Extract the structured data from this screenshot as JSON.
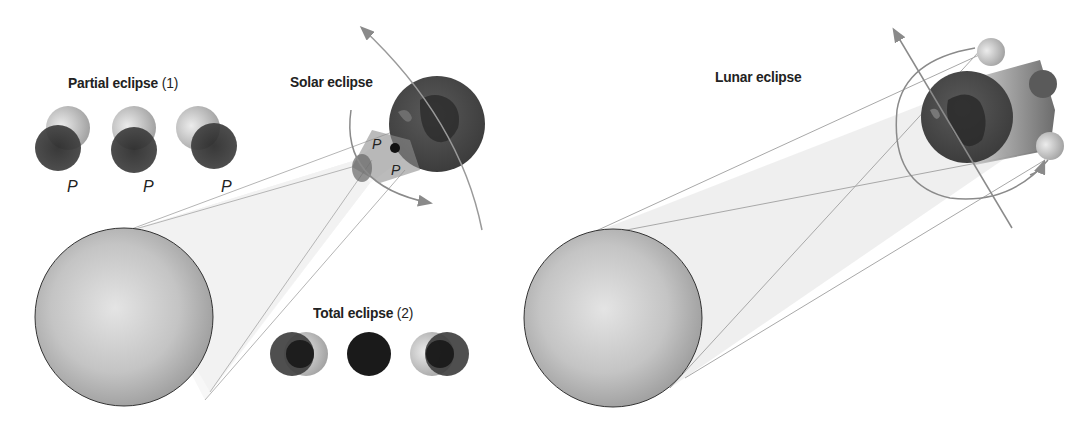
{
  "diagram": {
    "solar": {
      "title": "Solar eclipse",
      "partial": {
        "label": "Partial eclipse",
        "number": "(1)",
        "phase_marker": "P"
      },
      "total": {
        "label": "Total eclipse",
        "number": "(2)"
      },
      "penumbra_markers": [
        "P",
        "P"
      ],
      "bodies": [
        "sun",
        "moon",
        "earth"
      ]
    },
    "lunar": {
      "title": "Lunar eclipse",
      "bodies": [
        "sun",
        "earth",
        "moon"
      ]
    },
    "partial_markers": [
      "P",
      "P",
      "P"
    ],
    "colors": {
      "sun": "#b5b5b5",
      "earth": "#4a4a4a",
      "moon_dark": "#2b2b2b",
      "moon_light": "#d5d5d5",
      "cone": "#ececec",
      "line": "#9a9a9a",
      "arrow": "#888888"
    }
  }
}
